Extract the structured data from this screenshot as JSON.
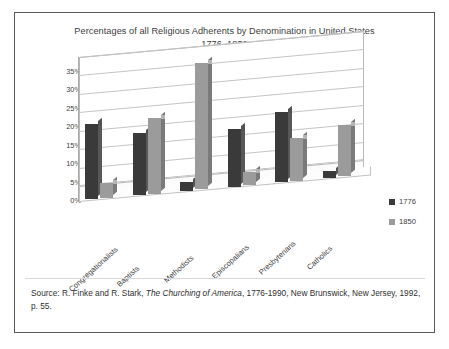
{
  "figure": {
    "title_line1": "Percentages of all Religious Adherents by Denomination in United States",
    "title_line2": "1776–1850",
    "source_prefix": "Source: R. Finke and R. Stark, ",
    "source_italic": "The Churching of America",
    "source_suffix": ", 1776-1990, New Brunswick, New Jersey, 1992, p. 55."
  },
  "legend": {
    "position": "right",
    "items": [
      {
        "label": "1776",
        "color": "#3a3a3a"
      },
      {
        "label": "1850",
        "color": "#9b9b9b"
      }
    ]
  },
  "chart_data": {
    "type": "bar",
    "title": "Percentages of all Religious Adherents by Denomination in United States 1776–1850",
    "xlabel": "",
    "ylabel": "",
    "ylim": [
      0,
      35
    ],
    "ytick_labels": [
      "0%",
      "5%",
      "10%",
      "15%",
      "20%",
      "25%",
      "30%",
      "35%"
    ],
    "ytick_values": [
      0,
      5,
      10,
      15,
      20,
      25,
      30,
      35
    ],
    "grid": true,
    "categories": [
      "Congregationalists",
      "Baptists",
      "Methodists",
      "Episcopalians",
      "Presbyterians",
      "Catholics"
    ],
    "series": [
      {
        "name": "1776",
        "color": "#3a3a3a",
        "values": [
          20.4,
          16.9,
          2.5,
          15.7,
          19.0,
          1.8
        ]
      },
      {
        "name": "1850",
        "color": "#9b9b9b",
        "values": [
          4.0,
          20.5,
          34.2,
          3.5,
          11.6,
          13.9
        ]
      }
    ]
  }
}
